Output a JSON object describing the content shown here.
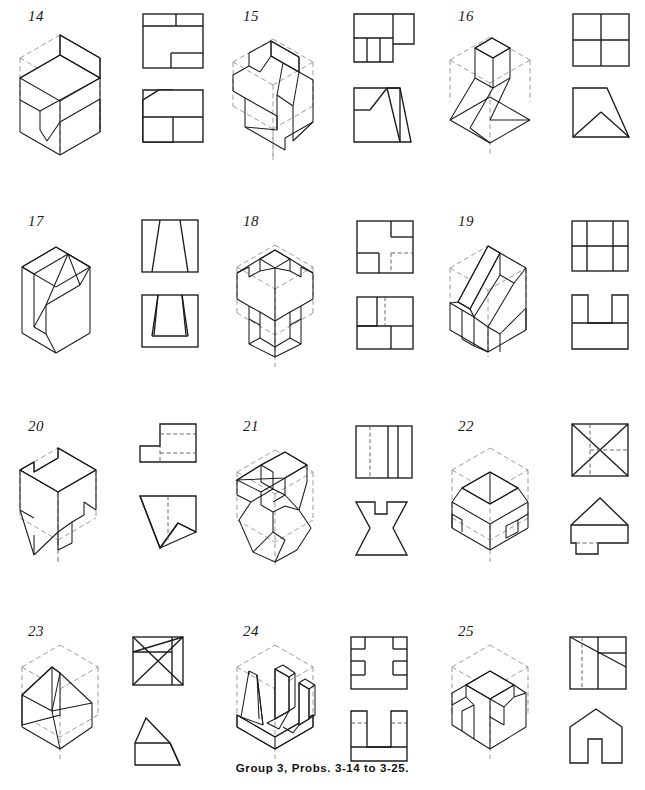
{
  "page": {
    "caption": "Group 3, Probs. 3-14 to 3-25.",
    "width": 645,
    "height": 790,
    "background_color": "#ffffff",
    "ink_color": "#1b1b1b",
    "hidden_line_color": "#555555",
    "construction_line_color": "#8a8a8a",
    "columns": 3,
    "rows": 4
  },
  "problems": [
    {
      "number": "14",
      "row": 1,
      "column": 1,
      "pictorial": {
        "type": "isometric",
        "description": "Rectangular block with a rectangular step cut removed from the upper left and a narrow vertical notch in the front left face",
        "has_construction_box": true
      },
      "views": [
        {
          "name": "top-view",
          "position": "upper-right",
          "shape": "square with horizontal divider near top and small rectangular step at lower right",
          "hidden_lines": false
        },
        {
          "name": "front-view",
          "position": "lower-right",
          "shape": "square with chamfered upper-left corner, horizontal divider and vertical divider below",
          "hidden_lines": false
        }
      ]
    },
    {
      "number": "15",
      "row": 1,
      "column": 2,
      "pictorial": {
        "type": "isometric",
        "description": "Block with an inclined wedge face cut on the front and a V-notch on the left side",
        "has_construction_box": true
      },
      "views": [
        {
          "name": "top-view",
          "position": "upper-right",
          "shape": "wide rectangle with projecting tab at right, lower band split into three vertical cells",
          "hidden_lines": false
        },
        {
          "name": "front-view",
          "position": "lower-right",
          "shape": "square with peaked triangular profile and a stepped notch at left, slanted right edge",
          "hidden_lines": false
        }
      ]
    },
    {
      "number": "16",
      "row": 1,
      "column": 3,
      "pictorial": {
        "type": "isometric",
        "description": "Inclined prism rising from a triangular wedge base, set inside the construction cube",
        "has_construction_box": true
      },
      "views": [
        {
          "name": "top-view",
          "position": "upper-right",
          "shape": "square divided into four equal quadrants",
          "hidden_lines": false
        },
        {
          "name": "front-view",
          "position": "lower-right",
          "shape": "square with chamfered upper-right corner containing an inscribed triangle rising from the base",
          "hidden_lines": false
        }
      ]
    },
    {
      "number": "17",
      "row": 2,
      "column": 1,
      "pictorial": {
        "type": "isometric",
        "description": "Cube with a tapering dovetail slot cut through from the top face down the front face",
        "has_construction_box": false
      },
      "views": [
        {
          "name": "top-view",
          "position": "upper-right",
          "shape": "rectangle with two inward-tapering vertical lines forming a trapezoidal slot",
          "hidden_lines": false
        },
        {
          "name": "front-view",
          "position": "lower-right",
          "shape": "rectangle with a tapering U-shaped slot open at the top",
          "hidden_lines": false
        }
      ]
    },
    {
      "number": "18",
      "row": 2,
      "column": 2,
      "pictorial": {
        "type": "isometric",
        "description": "Cube with square notches cut from all four vertical corner edges forming a cross-shaped plan",
        "has_construction_box": true
      },
      "views": [
        {
          "name": "top-view",
          "position": "upper-right",
          "shape": "square with a notch at upper right and a notch at lower left, hidden lines at lower right",
          "hidden_lines": true
        },
        {
          "name": "front-view",
          "position": "lower-right",
          "shape": "square with rectangular cell at left, hidden vertical centre line and rectangle at lower right",
          "hidden_lines": true
        }
      ]
    },
    {
      "number": "19",
      "row": 2,
      "column": 3,
      "pictorial": {
        "type": "isometric",
        "description": "Block with a pair of inclined ribs forming a chair-like seat and back, notch at the front",
        "has_construction_box": true
      },
      "views": [
        {
          "name": "top-view",
          "position": "upper-right",
          "shape": "square divided into a 3x2 arrangement of rectangles",
          "hidden_lines": false
        },
        {
          "name": "front-view",
          "position": "lower-right",
          "shape": "H-shaped outline with two tall legs joined by a horizontal web",
          "hidden_lines": false
        }
      ]
    },
    {
      "number": "20",
      "row": 3,
      "column": 1,
      "pictorial": {
        "type": "isometric",
        "description": "Block with a stepped notch cut at the top rear and an inclined wedge removed from the lower front, plus a small rectangular slot",
        "has_construction_box": true
      },
      "views": [
        {
          "name": "top-view",
          "position": "upper-right",
          "shape": "L-shaped outline with hidden lines crossing the vertical leg",
          "hidden_lines": true
        },
        {
          "name": "front-view",
          "position": "lower-right",
          "shape": "square outline with large triangular wedge removed and hidden vertical centre line",
          "hidden_lines": true
        }
      ]
    },
    {
      "number": "21",
      "row": 3,
      "column": 2,
      "pictorial": {
        "type": "isometric",
        "description": "Block with concave flared sides and a square channel cut along the top",
        "has_construction_box": true
      },
      "views": [
        {
          "name": "top-view",
          "position": "upper-right",
          "shape": "rectangle divided by three vertical lines, one of them hidden",
          "hidden_lines": true
        },
        {
          "name": "front-view",
          "position": "lower-right",
          "shape": "hourglass profile with concave sides and a square notch in the top edge",
          "hidden_lines": false
        }
      ]
    },
    {
      "number": "22",
      "row": 3,
      "column": 3,
      "pictorial": {
        "type": "isometric",
        "description": "Truncated pyramid frustum on a base block with small rectangular lugs projecting from two sides",
        "has_construction_box": true
      },
      "views": [
        {
          "name": "top-view",
          "position": "upper-right",
          "shape": "square with both diagonals drawn and hidden lines forming an inner rectangle",
          "hidden_lines": true
        },
        {
          "name": "front-view",
          "position": "lower-right",
          "shape": "triangular roof shape over a rectangular base with a projecting step at lower left",
          "hidden_lines": true
        }
      ]
    },
    {
      "number": "23",
      "row": 4,
      "column": 1,
      "pictorial": {
        "type": "isometric",
        "description": "Hip-roof solid: a prism with four sloping faces meeting at a ridge line",
        "has_construction_box": true
      },
      "views": [
        {
          "name": "top-view",
          "position": "upper-right",
          "shape": "square with hip-roof lines: a ridge line and four diagonals converging",
          "hidden_lines": false
        },
        {
          "name": "front-view",
          "position": "lower-right",
          "shape": "triangular gable above a rectangular base, right side slanted",
          "hidden_lines": false
        }
      ]
    },
    {
      "number": "24",
      "row": 4,
      "column": 2,
      "pictorial": {
        "type": "isometric",
        "description": "Base plate carrying four upright prisms - two tapered wedges and two rectangular posts",
        "has_construction_box": true
      },
      "views": [
        {
          "name": "top-view",
          "position": "upper-right",
          "shape": "square with four small rectangles at the corners and two at the mid sides",
          "hidden_lines": false
        },
        {
          "name": "front-view",
          "position": "lower-right",
          "shape": "U-shaped outline with two uprights on a base slab, hidden lines across the uprights",
          "hidden_lines": true
        }
      ]
    },
    {
      "number": "25",
      "row": 4,
      "column": 3,
      "pictorial": {
        "type": "isometric",
        "description": "House-like solid with gable roof, an arch notch cut in the left front face and an inclined face at the right",
        "has_construction_box": true
      },
      "views": [
        {
          "name": "top-view",
          "position": "upper-right",
          "shape": "square with hidden vertical lines and two slanted lines running to the right edge",
          "hidden_lines": true
        },
        {
          "name": "front-view",
          "position": "lower-right",
          "shape": "gable house outline with a square notch cut in the bottom centre",
          "hidden_lines": false
        }
      ]
    }
  ]
}
